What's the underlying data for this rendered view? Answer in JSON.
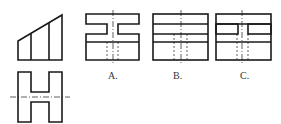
{
  "figure": {
    "given_views": {
      "front_view": "trapezoid-with-two-vertical-divisions",
      "top_view": "H-shape-with-horizontal-centerline"
    },
    "options": [
      {
        "label": "A.",
        "description": "left-view with T-shaped slot cut at top, hidden lines below"
      },
      {
        "label": "B.",
        "description": "left-view with three horizontal lines, hidden lines below"
      },
      {
        "label": "C.",
        "description": "left-view with two side rectangular slots, hidden lines below"
      }
    ],
    "colors": {
      "line": "#1a1a1a",
      "background": "#ffffff"
    }
  }
}
